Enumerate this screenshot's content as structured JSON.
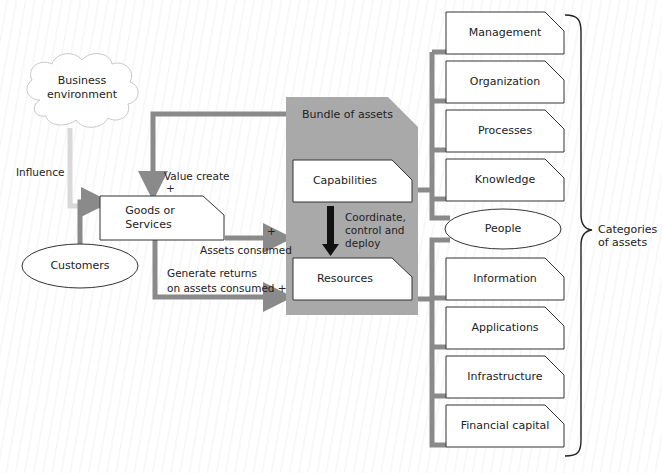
{
  "diagram": {
    "colors": {
      "connector": "#8a8a8a",
      "bundle_fill": "#a9a9a9",
      "influence": "#d9d9d9",
      "box_fill": "#ffffff",
      "box_stroke": "#333333",
      "arrow_dark": "#111111"
    },
    "nodes": {
      "business_environment": "Business\nenvironment",
      "business_environment_l1": "Business",
      "business_environment_l2": "environment",
      "customers": "Customers",
      "goods_services_l1": "Goods or",
      "goods_services_l2": "Services",
      "bundle_title": "Bundle of assets",
      "capabilities": "Capabilities",
      "resources": "Resources"
    },
    "edge_labels": {
      "influence": "Influence",
      "value_create": "Value create",
      "value_create_sign": "+",
      "assets_consumed": "Assets consumed",
      "assets_consumed_sign": "+",
      "generate_returns_l1": "Generate returns",
      "generate_returns_l2": "on assets consumed +",
      "coordinate_l1": "Coordinate,",
      "coordinate_l2": "control and",
      "coordinate_l3": "deploy"
    },
    "asset_categories": {
      "bracket_label_l1": "Categories",
      "bracket_label_l2": "of assets",
      "capability_items": [
        "Management",
        "Organization",
        "Processes",
        "Knowledge"
      ],
      "shared_item": "People",
      "resource_items": [
        "Information",
        "Applications",
        "Infrastructure",
        "Financial capital"
      ]
    }
  }
}
